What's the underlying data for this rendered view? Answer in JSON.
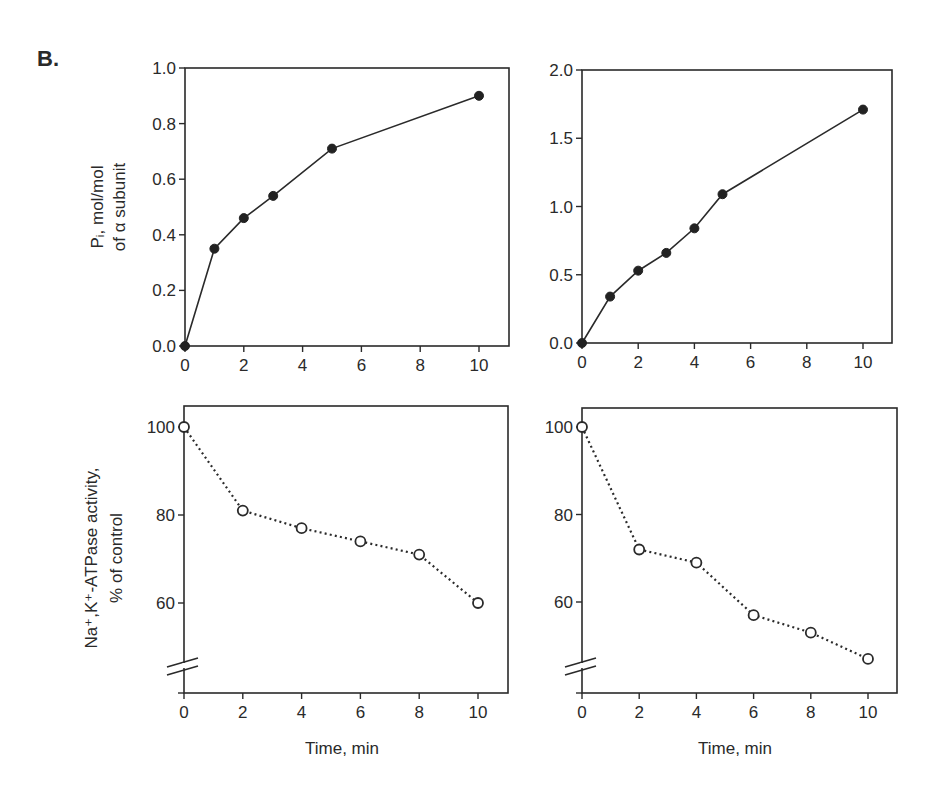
{
  "figure": {
    "panel_label": "B."
  },
  "chart_data": [
    {
      "id": "top-left",
      "type": "line",
      "marker": "filled-circle",
      "line_style": "solid",
      "x": [
        0,
        1,
        2,
        3,
        5,
        10
      ],
      "values": [
        0.0,
        0.35,
        0.46,
        0.54,
        0.71,
        0.9
      ],
      "title": "",
      "xlabel": "",
      "ylabel_lines": [
        "Pᵢ, mol/mol",
        "of α subunit"
      ],
      "xlim": [
        0,
        11
      ],
      "ylim": [
        0.0,
        1.0
      ],
      "xticks": [
        0,
        2,
        4,
        6,
        8,
        10
      ],
      "xtick_labels": [
        "0",
        "2",
        "4",
        "6",
        "8",
        "10"
      ],
      "yticks": [
        0.0,
        0.2,
        0.4,
        0.6,
        0.8,
        1.0
      ],
      "ytick_labels": [
        "0.0",
        "0.2",
        "0.4",
        "0.6",
        "0.8",
        "1.0"
      ],
      "grid": false,
      "axis_break": false,
      "box": {
        "left": 185,
        "top": 68,
        "right": 509,
        "bottom": 346,
        "x0": 185,
        "x10": 479
      }
    },
    {
      "id": "top-right",
      "type": "line",
      "marker": "filled-circle",
      "line_style": "solid",
      "x": [
        0,
        1,
        2,
        3,
        4,
        5,
        10
      ],
      "values": [
        0.0,
        0.34,
        0.53,
        0.66,
        0.84,
        1.09,
        1.71
      ],
      "title": "",
      "xlabel": "",
      "ylabel_lines": [],
      "xlim": [
        0,
        11
      ],
      "ylim": [
        0.0,
        2.0
      ],
      "xticks": [
        0,
        2,
        4,
        6,
        8,
        10
      ],
      "xtick_labels": [
        "0",
        "2",
        "4",
        "6",
        "8",
        "10"
      ],
      "yticks": [
        0.0,
        0.5,
        1.0,
        1.5,
        2.0
      ],
      "ytick_labels": [
        "0.0",
        "0.5",
        "1.0",
        "1.5",
        "2.0"
      ],
      "grid": false,
      "axis_break": false,
      "box": {
        "left": 582,
        "top": 70,
        "right": 892,
        "bottom": 343,
        "x0": 582,
        "x10": 863
      }
    },
    {
      "id": "bottom-left",
      "type": "line",
      "marker": "open-circle",
      "line_style": "dotted",
      "x": [
        0,
        2,
        4,
        6,
        8,
        10
      ],
      "values": [
        100,
        81,
        77,
        74,
        71,
        60
      ],
      "title": "",
      "xlabel": "Time, min",
      "ylabel_lines": [
        "Na⁺,K⁺-ATPase activity,",
        "% of control"
      ],
      "xlim": [
        0,
        11
      ],
      "ylim": [
        40,
        105
      ],
      "xticks": [
        0,
        2,
        4,
        6,
        8,
        10
      ],
      "xtick_labels": [
        "0",
        "2",
        "4",
        "6",
        "8",
        "10"
      ],
      "yticks": [
        60,
        80,
        100
      ],
      "ytick_labels": [
        "60",
        "80",
        "100"
      ],
      "grid": false,
      "axis_break": true,
      "box": {
        "left": 184,
        "top": 406,
        "right": 508,
        "bottom": 693,
        "x0": 184,
        "x10": 478,
        "y100": 427,
        "y60": 603
      }
    },
    {
      "id": "bottom-right",
      "type": "line",
      "marker": "open-circle",
      "line_style": "dotted",
      "x": [
        0,
        2,
        4,
        6,
        8,
        10
      ],
      "values": [
        100,
        72,
        69,
        57,
        53,
        47
      ],
      "title": "",
      "xlabel": "Time, min",
      "ylabel_lines": [],
      "xlim": [
        0,
        11
      ],
      "ylim": [
        40,
        105
      ],
      "xticks": [
        0,
        2,
        4,
        6,
        8,
        10
      ],
      "xtick_labels": [
        "0",
        "2",
        "4",
        "6",
        "8",
        "10"
      ],
      "yticks": [
        60,
        80,
        100
      ],
      "ytick_labels": [
        "60",
        "80",
        "100"
      ],
      "grid": false,
      "axis_break": true,
      "box": {
        "left": 582,
        "top": 408,
        "right": 897,
        "bottom": 693,
        "x0": 582,
        "x10": 868,
        "y100": 427,
        "y60": 602
      }
    }
  ]
}
